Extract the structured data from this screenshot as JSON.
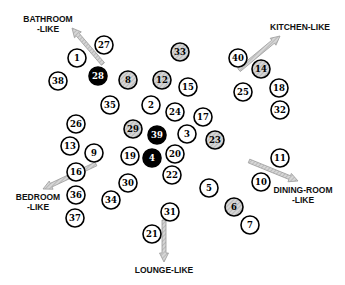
{
  "diagram": {
    "type": "node-cluster-map",
    "node_radius": 9,
    "styles": {
      "plain": {
        "fill": "#ffffff",
        "stroke": "#000000",
        "text": "#000000"
      },
      "shaded": {
        "fill": "#c8c8c8",
        "stroke": "#000000",
        "text": "#000000"
      },
      "dark": {
        "fill": "#000000",
        "stroke": "#000000",
        "text": "#ffffff"
      }
    },
    "arrow_color": "#9a9a9a",
    "nodes": [
      {
        "id": "27",
        "x": 104,
        "y": 45,
        "style": "plain"
      },
      {
        "id": "1",
        "x": 77,
        "y": 58,
        "style": "plain"
      },
      {
        "id": "28",
        "x": 98,
        "y": 76,
        "style": "dark"
      },
      {
        "id": "38",
        "x": 58,
        "y": 81,
        "style": "plain"
      },
      {
        "id": "8",
        "x": 128,
        "y": 80,
        "style": "shaded"
      },
      {
        "id": "12",
        "x": 162,
        "y": 80,
        "style": "shaded"
      },
      {
        "id": "33",
        "x": 180,
        "y": 52,
        "style": "shaded"
      },
      {
        "id": "15",
        "x": 188,
        "y": 87,
        "style": "plain"
      },
      {
        "id": "35",
        "x": 110,
        "y": 105,
        "style": "plain"
      },
      {
        "id": "2",
        "x": 151,
        "y": 105,
        "style": "plain"
      },
      {
        "id": "24",
        "x": 175,
        "y": 112,
        "style": "plain"
      },
      {
        "id": "17",
        "x": 203,
        "y": 117,
        "style": "plain"
      },
      {
        "id": "40",
        "x": 238,
        "y": 58,
        "style": "plain"
      },
      {
        "id": "14",
        "x": 261,
        "y": 69,
        "style": "shaded"
      },
      {
        "id": "25",
        "x": 243,
        "y": 92,
        "style": "plain"
      },
      {
        "id": "18",
        "x": 279,
        "y": 88,
        "style": "plain"
      },
      {
        "id": "32",
        "x": 280,
        "y": 110,
        "style": "plain"
      },
      {
        "id": "26",
        "x": 76,
        "y": 124,
        "style": "plain"
      },
      {
        "id": "29",
        "x": 133,
        "y": 129,
        "style": "shaded"
      },
      {
        "id": "39",
        "x": 157,
        "y": 135,
        "style": "dark"
      },
      {
        "id": "3",
        "x": 187,
        "y": 134,
        "style": "plain"
      },
      {
        "id": "23",
        "x": 215,
        "y": 140,
        "style": "shaded"
      },
      {
        "id": "13",
        "x": 70,
        "y": 146,
        "style": "plain"
      },
      {
        "id": "9",
        "x": 94,
        "y": 153,
        "style": "plain"
      },
      {
        "id": "19",
        "x": 130,
        "y": 156,
        "style": "plain"
      },
      {
        "id": "4",
        "x": 152,
        "y": 158,
        "style": "dark"
      },
      {
        "id": "20",
        "x": 175,
        "y": 154,
        "style": "plain"
      },
      {
        "id": "22",
        "x": 172,
        "y": 175,
        "style": "plain"
      },
      {
        "id": "16",
        "x": 76,
        "y": 172,
        "style": "plain"
      },
      {
        "id": "30",
        "x": 128,
        "y": 183,
        "style": "plain"
      },
      {
        "id": "34",
        "x": 111,
        "y": 200,
        "style": "plain"
      },
      {
        "id": "36",
        "x": 76,
        "y": 195,
        "style": "plain"
      },
      {
        "id": "37",
        "x": 75,
        "y": 218,
        "style": "plain"
      },
      {
        "id": "11",
        "x": 280,
        "y": 158,
        "style": "plain"
      },
      {
        "id": "10",
        "x": 261,
        "y": 182,
        "style": "plain"
      },
      {
        "id": "5",
        "x": 209,
        "y": 188,
        "style": "plain"
      },
      {
        "id": "6",
        "x": 234,
        "y": 207,
        "style": "shaded"
      },
      {
        "id": "7",
        "x": 250,
        "y": 225,
        "style": "plain"
      },
      {
        "id": "31",
        "x": 170,
        "y": 212,
        "style": "plain"
      },
      {
        "id": "21",
        "x": 152,
        "y": 234,
        "style": "plain"
      }
    ],
    "regions": [
      {
        "name": "bathroom",
        "lines": [
          "BATHROOM",
          "-LIKE"
        ],
        "label_x": 48,
        "label_y": 22,
        "anchor": "middle",
        "arrow": {
          "x1": 103,
          "y1": 64,
          "x2": 72,
          "y2": 28
        }
      },
      {
        "name": "kitchen",
        "lines": [
          "KITCHEN-LIKE"
        ],
        "label_x": 300,
        "label_y": 30,
        "anchor": "middle",
        "arrow": {
          "x1": 239,
          "y1": 70,
          "x2": 280,
          "y2": 36
        }
      },
      {
        "name": "bedroom",
        "lines": [
          "BEDROOM",
          "-LIKE"
        ],
        "label_x": 38,
        "label_y": 200,
        "anchor": "middle",
        "arrow": {
          "x1": 96,
          "y1": 164,
          "x2": 43,
          "y2": 189
        }
      },
      {
        "name": "dining-room",
        "lines": [
          "DINING-ROOM",
          "-LIKE"
        ],
        "label_x": 303,
        "label_y": 193,
        "anchor": "middle",
        "arrow": {
          "x1": 249,
          "y1": 161,
          "x2": 298,
          "y2": 181
        }
      },
      {
        "name": "lounge",
        "lines": [
          "LOUNGE-LIKE"
        ],
        "label_x": 164,
        "label_y": 273,
        "anchor": "middle",
        "arrow": {
          "x1": 164,
          "y1": 220,
          "x2": 164,
          "y2": 262
        }
      }
    ]
  }
}
